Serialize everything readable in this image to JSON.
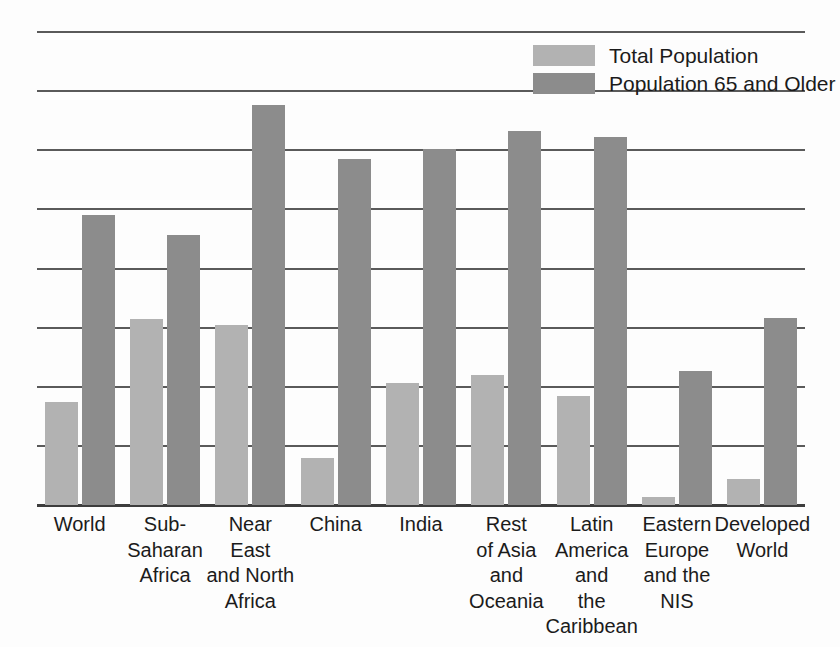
{
  "chart_data": {
    "type": "bar",
    "title": "",
    "subtitle": "",
    "xlabel": "",
    "ylabel": "",
    "ylim": [
      0,
      4.0
    ],
    "yticks": [
      "0",
      "0.5",
      "1.0",
      "1.5",
      "2.0",
      "2.5",
      "3.0",
      "3.5",
      "4.0"
    ],
    "ytick_values": [
      0,
      0.5,
      1.0,
      1.5,
      2.0,
      2.5,
      3.0,
      3.5,
      4.0
    ],
    "grid": true,
    "legend_position": "top-right",
    "categories": [
      "World",
      "Sub-\nSaharan\nAfrica",
      "Near\nEast\nand North\nAfrica",
      "China",
      "India",
      "Rest\nof Asia\nand\nOceania",
      "Latin\nAmerica\nand\nthe\nCaribbean",
      "Eastern\nEurope\nand the\nNIS",
      "Developed\nWorld"
    ],
    "series": [
      {
        "name": "Total Population",
        "color": "#b2b2b2",
        "values": [
          0.87,
          1.57,
          1.52,
          0.4,
          1.03,
          1.1,
          0.92,
          0.07,
          0.22
        ]
      },
      {
        "name": "Population 65 and Older",
        "color": "#8c8c8c",
        "values": [
          2.45,
          2.28,
          3.38,
          2.93,
          3.01,
          3.16,
          3.11,
          1.13,
          1.58
        ]
      }
    ]
  },
  "legend": {
    "items": [
      {
        "label": "Total Population",
        "color": "#b2b2b2"
      },
      {
        "label": "Population 65 and Older",
        "color": "#8c8c8c"
      }
    ]
  },
  "colors": {
    "total_population": "#b2b2b2",
    "population_65_and_older": "#8c8c8c",
    "gridline": "#5a5a5a",
    "axis": "#3d3d3d",
    "text": "#1b1b1b",
    "background": "#fdfdfd"
  }
}
